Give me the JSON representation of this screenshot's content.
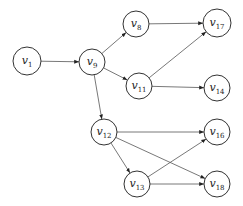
{
  "diagram": {
    "type": "directed-graph",
    "nodes": [
      {
        "id": "v1",
        "label": "v",
        "sub": "1",
        "x": 27,
        "y": 61,
        "r": 14
      },
      {
        "id": "v9",
        "label": "v",
        "sub": "9",
        "x": 92,
        "y": 62,
        "r": 13
      },
      {
        "id": "v8",
        "label": "v",
        "sub": "8",
        "x": 136,
        "y": 24,
        "r": 13
      },
      {
        "id": "v17",
        "label": "v",
        "sub": "17",
        "x": 217,
        "y": 23,
        "r": 14
      },
      {
        "id": "v11",
        "label": "v",
        "sub": "11",
        "x": 139,
        "y": 86,
        "r": 13
      },
      {
        "id": "v14",
        "label": "v",
        "sub": "14",
        "x": 217,
        "y": 88,
        "r": 13
      },
      {
        "id": "v12",
        "label": "v",
        "sub": "12",
        "x": 104,
        "y": 132,
        "r": 13
      },
      {
        "id": "v16",
        "label": "v",
        "sub": "16",
        "x": 217,
        "y": 132,
        "r": 13
      },
      {
        "id": "v13",
        "label": "v",
        "sub": "13",
        "x": 137,
        "y": 184,
        "r": 13
      },
      {
        "id": "v18",
        "label": "v",
        "sub": "18",
        "x": 217,
        "y": 184,
        "r": 13
      }
    ],
    "edges": [
      {
        "from": "v1",
        "to": "v9"
      },
      {
        "from": "v9",
        "to": "v8"
      },
      {
        "from": "v9",
        "to": "v11"
      },
      {
        "from": "v9",
        "to": "v12"
      },
      {
        "from": "v8",
        "to": "v17"
      },
      {
        "from": "v11",
        "to": "v17"
      },
      {
        "from": "v11",
        "to": "v14"
      },
      {
        "from": "v12",
        "to": "v16"
      },
      {
        "from": "v12",
        "to": "v18"
      },
      {
        "from": "v12",
        "to": "v13"
      },
      {
        "from": "v13",
        "to": "v16"
      },
      {
        "from": "v13",
        "to": "v18"
      }
    ]
  }
}
